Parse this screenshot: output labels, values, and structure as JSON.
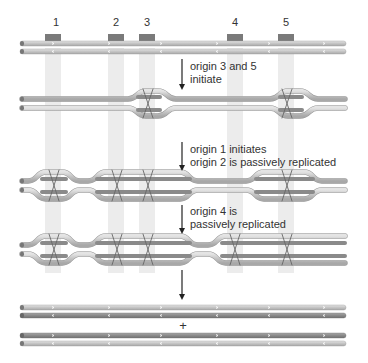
{
  "origins": [
    {
      "id": "1",
      "x": 53
    },
    {
      "id": "2",
      "x": 116
    },
    {
      "id": "3",
      "x": 147
    },
    {
      "id": "4",
      "x": 235
    },
    {
      "id": "5",
      "x": 286
    }
  ],
  "steps": [
    {
      "line1": "origin 3 and 5",
      "line2": "initiate"
    },
    {
      "line1": "origin 1 initiates",
      "line2": "origin 2 is passively replicated"
    },
    {
      "line1": "origin 4 is",
      "line2": "passively replicated"
    }
  ],
  "result_separator": "+",
  "colors": {
    "parental_strand": "#c8c8c8",
    "new_strand": "#8a8a8a",
    "origin_marker": "#7a7a7a",
    "origin_stripe": "#ececec",
    "arrow": "#222222",
    "text": "#333333"
  }
}
